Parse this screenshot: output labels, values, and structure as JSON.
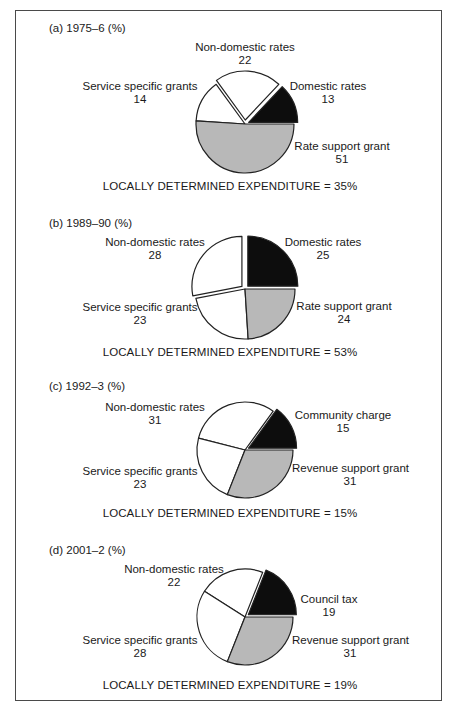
{
  "colors": {
    "black": "#0d0d0d",
    "grey": "#b8b8b8",
    "white": "#ffffff",
    "stroke": "#222222"
  },
  "chart_data": [
    {
      "type": "pie",
      "title": "(a) 1975–6 (%)",
      "footer": "LOCALLY DETERMINED EXPENDITURE = 35%",
      "slices": [
        {
          "label": "Domestic rates",
          "value": 13,
          "fill": "black",
          "exploded": true
        },
        {
          "label": "Non-domestic rates",
          "value": 22,
          "fill": "white",
          "exploded": true
        },
        {
          "label": "Service specific grants",
          "value": 14,
          "fill": "white",
          "exploded": false
        },
        {
          "label": "Rate support grant",
          "value": 51,
          "fill": "grey",
          "exploded": false
        }
      ]
    },
    {
      "type": "pie",
      "title": "(b) 1989–90 (%)",
      "footer": "LOCALLY DETERMINED EXPENDITURE = 53%",
      "slices": [
        {
          "label": "Domestic rates",
          "value": 25,
          "fill": "black",
          "exploded": true
        },
        {
          "label": "Non-domestic rates",
          "value": 28,
          "fill": "white",
          "exploded": true
        },
        {
          "label": "Service specific grants",
          "value": 23,
          "fill": "white",
          "exploded": false
        },
        {
          "label": "Rate support grant",
          "value": 24,
          "fill": "grey",
          "exploded": false
        }
      ]
    },
    {
      "type": "pie",
      "title": "(c) 1992–3 (%)",
      "footer": "LOCALLY DETERMINED EXPENDITURE = 15%",
      "slices": [
        {
          "label": "Community charge",
          "value": 15,
          "fill": "black",
          "exploded": true
        },
        {
          "label": "Non-domestic rates",
          "value": 31,
          "fill": "white",
          "exploded": false
        },
        {
          "label": "Service specific grants",
          "value": 23,
          "fill": "white",
          "exploded": false
        },
        {
          "label": "Revenue support grant",
          "value": 31,
          "fill": "grey",
          "exploded": false
        }
      ]
    },
    {
      "type": "pie",
      "title": "(d) 2001–2 (%)",
      "footer": "LOCALLY DETERMINED EXPENDITURE = 19%",
      "slices": [
        {
          "label": "Council tax",
          "value": 19,
          "fill": "black",
          "exploded": true
        },
        {
          "label": "Non-domestic rates",
          "value": 22,
          "fill": "white",
          "exploded": false
        },
        {
          "label": "Service specific grants",
          "value": 28,
          "fill": "white",
          "exploded": false
        },
        {
          "label": "Revenue support grant",
          "value": 31,
          "fill": "grey",
          "exploded": false
        }
      ]
    }
  ]
}
